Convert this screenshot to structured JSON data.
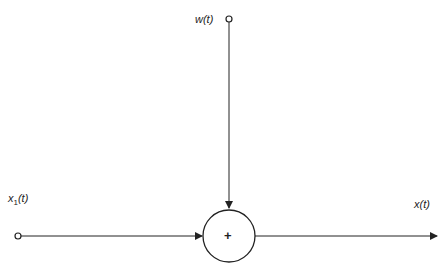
{
  "diagram": {
    "type": "summing-junction",
    "nodes": {
      "input_x1": {
        "label_base": "x",
        "label_sub": "1",
        "label_arg": "(t)"
      },
      "input_w": {
        "label": "w(t)"
      },
      "summer": {
        "symbol": "+"
      },
      "output_x": {
        "label": "x(t)"
      }
    },
    "edges": [
      {
        "from": "input_x1",
        "to": "summer"
      },
      {
        "from": "input_w",
        "to": "summer"
      },
      {
        "from": "summer",
        "to": "output_x"
      }
    ],
    "colors": {
      "stroke": "#222222",
      "background": "#ffffff"
    }
  }
}
